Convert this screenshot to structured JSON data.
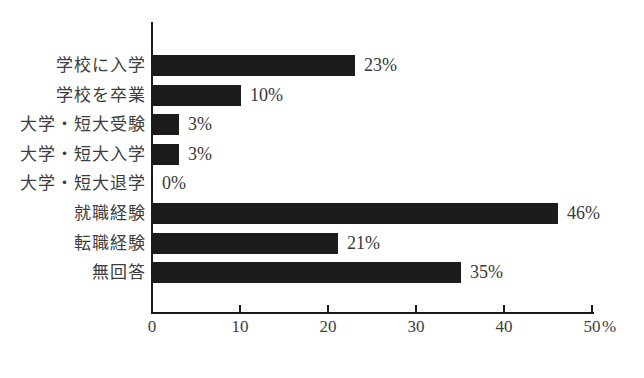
{
  "chart_data": {
    "type": "bar",
    "orientation": "horizontal",
    "title": "",
    "categories": [
      "学校に入学",
      "学校を卒業",
      "大学・短大受験",
      "大学・短大入学",
      "大学・短大退学",
      "就職経験",
      "転職経験",
      "無回答"
    ],
    "values": [
      23,
      10,
      3,
      3,
      0,
      46,
      21,
      35
    ],
    "value_labels": [
      "23%",
      "10%",
      "3%",
      "3%",
      "0%",
      "46%",
      "21%",
      "35%"
    ],
    "xlabel": "",
    "ylabel": "",
    "xlim": [
      0,
      50
    ],
    "x_ticks": [
      "0",
      "10",
      "20",
      "30",
      "40",
      "50"
    ],
    "x_tick_values": [
      0,
      10,
      20,
      30,
      40,
      50
    ],
    "x_axis_unit": "%",
    "grid": "off",
    "legend": "none",
    "bar_color": "#1c1c1c",
    "axis_color": "#1a1a1a",
    "text_color": "#3d3d3d",
    "background_color": "#ffffff"
  }
}
